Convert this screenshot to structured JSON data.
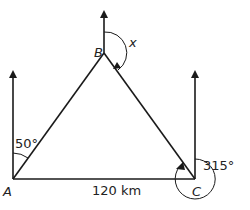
{
  "diagram": {
    "type": "bearings-triangle",
    "points": {
      "A": {
        "label": "A"
      },
      "B": {
        "label": "B"
      },
      "C": {
        "label": "C"
      }
    },
    "angles": {
      "A": "50°",
      "B": "x",
      "C": "315°"
    },
    "sides": {
      "AC": "120 km"
    },
    "colors": {
      "line": "#1a1a1a",
      "text": "#222222"
    }
  }
}
